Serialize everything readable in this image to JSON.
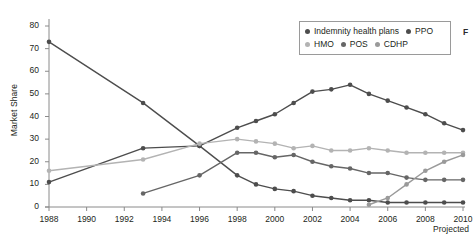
{
  "chart_data": {
    "type": "line",
    "title": "",
    "xlabel": "",
    "ylabel": "Market Share",
    "xlim": [
      1988,
      2010
    ],
    "ylim": [
      0,
      80
    ],
    "ytick_step": 10,
    "grid": false,
    "legend_position": "top-right",
    "x_tick_labels": [
      "1988",
      "1990",
      "1992",
      "1994",
      "1996",
      "1998",
      "2000",
      "2002",
      "2004",
      "2006",
      "2008",
      "2010"
    ],
    "x_ticks": [
      1988,
      1990,
      1992,
      1994,
      1996,
      1998,
      2000,
      2002,
      2004,
      2006,
      2008,
      2010
    ],
    "y_tick_labels": [
      "0",
      "10",
      "20",
      "30",
      "40",
      "50",
      "60",
      "70",
      "80"
    ],
    "y_ticks": [
      0,
      10,
      20,
      30,
      40,
      50,
      60,
      70,
      80
    ],
    "annotation": "Projected",
    "series": [
      {
        "name": "Indemnity health plans",
        "color": "#4d4d4d",
        "x": [
          1988,
          1993,
          1996,
          1998,
          1999,
          2000,
          2001,
          2002,
          2003,
          2004,
          2005,
          2006,
          2007,
          2008,
          2009,
          2010
        ],
        "values": [
          73,
          46,
          27,
          14,
          10,
          8,
          7,
          5,
          4,
          3,
          3,
          2,
          2,
          2,
          2,
          2
        ]
      },
      {
        "name": "PPO",
        "color": "#4d4d4d",
        "x": [
          1988,
          1993,
          1996,
          1998,
          1999,
          2000,
          2001,
          2002,
          2003,
          2004,
          2005,
          2006,
          2007,
          2008,
          2009,
          2010
        ],
        "values": [
          11,
          26,
          27,
          35,
          38,
          41,
          46,
          51,
          52,
          54,
          50,
          47,
          44,
          41,
          37,
          34
        ]
      },
      {
        "name": "HMO",
        "color": "#b3b3b3",
        "x": [
          1988,
          1993,
          1996,
          1998,
          1999,
          2000,
          2001,
          2002,
          2003,
          2004,
          2005,
          2006,
          2007,
          2008,
          2009,
          2010
        ],
        "values": [
          16,
          21,
          28,
          30,
          29,
          28,
          26,
          27,
          25,
          25,
          26,
          25,
          24,
          24,
          24,
          24
        ]
      },
      {
        "name": "POS",
        "color": "#666666",
        "x": [
          1993,
          1996,
          1998,
          1999,
          2000,
          2001,
          2002,
          2003,
          2004,
          2005,
          2006,
          2007,
          2008,
          2009,
          2010
        ],
        "values": [
          6,
          14,
          24,
          24,
          22,
          23,
          20,
          18,
          17,
          15,
          15,
          13,
          12,
          12,
          12
        ]
      },
      {
        "name": "CDHP",
        "color": "#9a9a9a",
        "x": [
          2005,
          2006,
          2007,
          2008,
          2009,
          2010
        ],
        "values": [
          1,
          4,
          10,
          16,
          20,
          23
        ]
      }
    ]
  },
  "legend": {
    "rows": [
      [
        {
          "label": "Indemnity health plans",
          "color": "#4d4d4d"
        },
        {
          "label": "PPO",
          "color": "#4d4d4d"
        }
      ],
      [
        {
          "label": "HMO",
          "color": "#b3b3b3"
        },
        {
          "label": "POS",
          "color": "#666666"
        },
        {
          "label": "CDHP",
          "color": "#9a9a9a"
        }
      ]
    ]
  },
  "edge_fragment": "F"
}
